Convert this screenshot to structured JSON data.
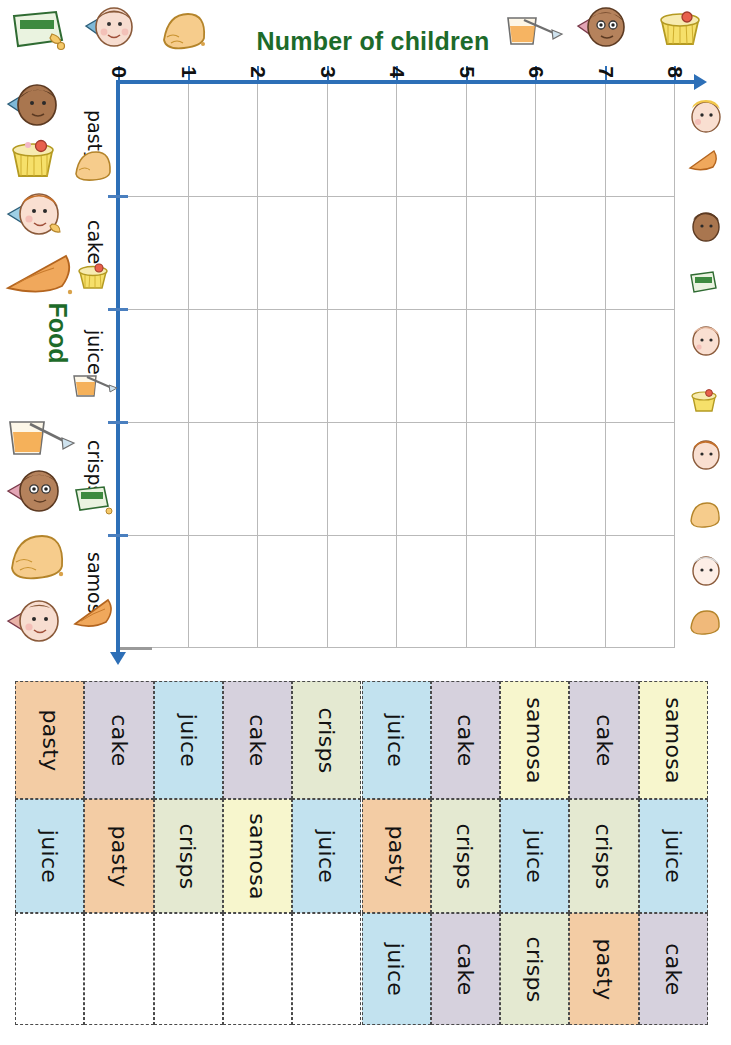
{
  "chart": {
    "title": "Number of children",
    "category_axis_label": "Food",
    "title_color": "#1d6b2a",
    "axis_color": "#2d6fb7",
    "x_ticks": [
      "0",
      "1",
      "2",
      "3",
      "4",
      "5",
      "6",
      "7",
      "8"
    ],
    "categories": [
      "pasty",
      "cake",
      "juice",
      "crisps",
      "samosa"
    ],
    "orientation": "rotated-90-clockwise"
  },
  "chart_data": {
    "type": "bar",
    "title": "Number of children",
    "xlabel": "Number of children",
    "ylabel": "Food",
    "categories": [
      "pasty",
      "cake",
      "juice",
      "crisps",
      "samosa"
    ],
    "values": [
      0,
      0,
      0,
      0,
      0
    ],
    "xlim": [
      0,
      8
    ],
    "xticks": [
      0,
      1,
      2,
      3,
      4,
      5,
      6,
      7,
      8
    ],
    "grid": true,
    "legend": "none",
    "note": "empty grid - bars to be drawn by the pupil"
  },
  "table": {
    "colors": {
      "pasty": "#f3cca4",
      "cake": "#d6d1dd",
      "juice": "#c2e2ef",
      "crisps": "#e4e9d1",
      "samosa": "#f7f6cd",
      "empty": "#ffffff"
    },
    "columns": [
      [
        "pasty",
        "juice",
        ""
      ],
      [
        "cake",
        "pasty",
        ""
      ],
      [
        "juice",
        "crisps",
        ""
      ],
      [
        "cake",
        "samosa",
        ""
      ],
      [
        "crisps",
        "juice",
        ""
      ],
      [
        "juice",
        "pasty",
        "juice"
      ],
      [
        "cake",
        "crisps",
        "cake"
      ],
      [
        "samosa",
        "juice",
        "crisps"
      ],
      [
        "cake",
        "crisps",
        "pasty"
      ],
      [
        "samosa",
        "juice",
        "cake"
      ]
    ]
  },
  "illustrations": {
    "top_row": [
      "crisps-packet-icon",
      "child-face-icon",
      "pasty-icon",
      "juice-glass-icon",
      "child-face-icon",
      "cake-icon"
    ],
    "left_column": [
      "child-face-icon",
      "cake-icon",
      "child-face-icon",
      "samosa-icon",
      "juice-glass-icon",
      "child-face-icon",
      "pasty-icon",
      "child-face-icon"
    ],
    "axis_inline": [
      "pasty-icon",
      "cake-icon",
      "juice-glass-icon",
      "crisps-packet-icon",
      "samosa-icon"
    ],
    "right_column": [
      "child-face-icon",
      "samosa-icon",
      "child-face-icon",
      "crisps-packet-icon",
      "child-face-icon",
      "cake-icon",
      "child-face-icon",
      "pasty-icon",
      "child-face-icon",
      "pasty-icon"
    ]
  }
}
